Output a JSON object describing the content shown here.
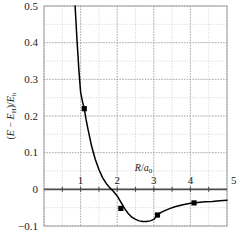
{
  "figure": {
    "title": "",
    "background_color": "#ffffff",
    "curve_color": "#000000",
    "marker_color": "#000000",
    "grid_color": "#b9b9b9",
    "axis_color": "#4d4d4d"
  },
  "chart_data": {
    "type": "line",
    "title": "",
    "subtitle": "",
    "xlabel": "R/a0",
    "xlabel_display": "R/a₀",
    "ylabel": "(E - E_H)/E_h",
    "ylabel_display": "(E − E_H)/E_h",
    "xlim": [
      0,
      5
    ],
    "ylim": [
      -0.1,
      0.5
    ],
    "xticks": [
      0,
      1,
      2,
      3,
      4,
      5
    ],
    "xtick_labels": [
      "",
      "1",
      "2",
      "3",
      "4",
      "5"
    ],
    "yticks": [
      -0.1,
      0,
      0.1,
      0.2,
      0.3,
      0.4,
      0.5
    ],
    "ytick_labels": [
      "-0.1",
      "0",
      "0.1",
      "0.2",
      "0.3",
      "0.4",
      "0.5"
    ],
    "grid": true,
    "grid_major_x_step": 1.0,
    "grid_major_y_step": 0.1,
    "grid_minor_x_step": 0.5,
    "grid_minor_y_step": 0.05,
    "legend": null,
    "legend_position": "none",
    "zero_line": 0,
    "series": [
      {
        "name": "Morse-like potential curve",
        "type": "line",
        "x": [
          0.85,
          0.9,
          0.95,
          1.0,
          1.05,
          1.1,
          1.15,
          1.2,
          1.3,
          1.4,
          1.5,
          1.6,
          1.7,
          1.8,
          1.9,
          2.0,
          2.1,
          2.2,
          2.3,
          2.4,
          2.5,
          2.6,
          2.7,
          2.8,
          2.9,
          3.0,
          3.1,
          3.2,
          3.3,
          3.4,
          3.5,
          3.6,
          3.8,
          4.0,
          4.2,
          4.4,
          4.6,
          4.8,
          5.0
        ],
        "y": [
          0.5,
          0.41,
          0.33,
          0.265,
          0.24,
          0.22,
          0.19,
          0.165,
          0.118,
          0.082,
          0.054,
          0.032,
          0.016,
          0.004,
          -0.006,
          -0.018,
          -0.035,
          -0.052,
          -0.066,
          -0.076,
          -0.082,
          -0.086,
          -0.088,
          -0.088,
          -0.086,
          -0.082,
          -0.07,
          -0.063,
          -0.058,
          -0.054,
          -0.05,
          -0.047,
          -0.042,
          -0.038,
          -0.036,
          -0.034,
          -0.033,
          -0.031,
          -0.03
        ]
      },
      {
        "name": "computed points",
        "type": "scatter",
        "marker": "square",
        "x": [
          1.1,
          2.1,
          3.1,
          4.1
        ],
        "y": [
          0.22,
          -0.052,
          -0.07,
          -0.037
        ]
      }
    ]
  }
}
